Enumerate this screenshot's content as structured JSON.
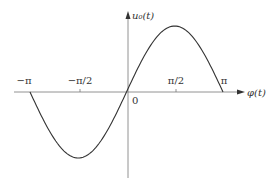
{
  "chart_data": {
    "type": "line",
    "title": "",
    "xlabel": "φ(t)",
    "ylabel": "u₀(t)",
    "x_ticks": [
      "−π",
      "−π/2",
      "π/2",
      "π"
    ],
    "origin_label": "0",
    "function": "sin(φ)",
    "x": [
      -3.1416,
      -1.5708,
      0,
      1.5708,
      3.1416
    ],
    "values": [
      0,
      -1,
      0,
      1,
      0
    ],
    "xlim": [
      -3.1416,
      3.1416
    ],
    "ylim": [
      -1,
      1
    ],
    "grid": false,
    "legend": null
  },
  "labels": {
    "y_axis": "u₀(t)",
    "x_axis": "φ(t)",
    "tick_neg_pi": "−π",
    "tick_neg_half_pi": "−π/2",
    "tick_half_pi": "π/2",
    "tick_pi": "π",
    "origin": "0"
  },
  "colors": {
    "axis": "#555555",
    "curve": "#333333",
    "text": "#333333"
  }
}
